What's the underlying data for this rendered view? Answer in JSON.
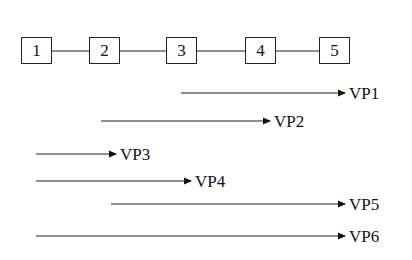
{
  "nodes": [
    {
      "label": "1",
      "x": 21
    },
    {
      "label": "2",
      "x": 89
    },
    {
      "label": "3",
      "x": 166
    },
    {
      "label": "4",
      "x": 245
    },
    {
      "label": "5",
      "x": 319
    }
  ],
  "paths": [
    {
      "label": "VP1",
      "x1": 181,
      "x2": 345,
      "y": 93
    },
    {
      "label": "VP2",
      "x1": 101,
      "x2": 270,
      "y": 121
    },
    {
      "label": "VP3",
      "x1": 36,
      "x2": 116,
      "y": 154
    },
    {
      "label": "VP4",
      "x1": 36,
      "x2": 191,
      "y": 181
    },
    {
      "label": "VP5",
      "x1": 111,
      "x2": 345,
      "y": 204
    },
    {
      "label": "VP6",
      "x1": 36,
      "x2": 345,
      "y": 236
    }
  ]
}
